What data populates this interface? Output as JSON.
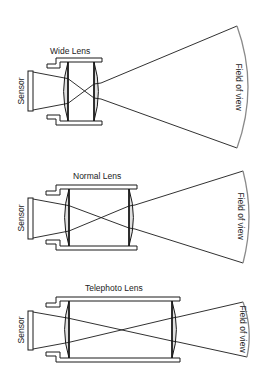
{
  "figure": {
    "width": 267,
    "height": 387,
    "background": "#ffffff",
    "line_color": "#1a1a1a",
    "lens_fill": "#e0e0e0",
    "arc_color": "#8a8a8a"
  },
  "diagrams": [
    {
      "id": "wide",
      "title": "Wide Lens",
      "sensor_label": "Sensor",
      "fov_label": "Field of view",
      "title_pos": [
        50,
        54
      ],
      "sensor_label_pos": [
        24,
        91
      ],
      "fov_label_pos": [
        236,
        87
      ],
      "housing": {
        "step_x": 47,
        "barrel_left": 56,
        "barrel_right": 102,
        "top": 58,
        "step_top": 64,
        "step_bottom": 119,
        "bottom": 125,
        "wall": 4
      },
      "sensor": {
        "x": 28,
        "y_top": 71,
        "y_bottom": 111,
        "w": 5
      },
      "lens_left": {
        "x": 68,
        "bulge": 4
      },
      "lens_right": {
        "x": 94,
        "bulge": 4
      },
      "rays": {
        "sensor_top": [
          33,
          72
        ],
        "sensor_bottom": [
          33,
          110
        ],
        "cross_x": 81,
        "cross_y": 91,
        "exit_top": [
          101,
          83
        ],
        "exit_bottom": [
          101,
          99
        ]
      },
      "fov": {
        "top": [
          237,
          26
        ],
        "bottom": [
          237,
          148
        ],
        "bulge": 11
      }
    },
    {
      "id": "normal",
      "title": "Normal Lens",
      "sensor_label": "Sensor",
      "fov_label": "Field of view",
      "title_pos": [
        73,
        179
      ],
      "sensor_label_pos": [
        24,
        218
      ],
      "fov_label_pos": [
        238,
        216
      ],
      "housing": {
        "step_x": 46,
        "barrel_left": 56,
        "barrel_right": 137,
        "top": 185,
        "step_top": 191,
        "step_bottom": 244,
        "bottom": 250,
        "wall": 4
      },
      "sensor": {
        "x": 28,
        "y_top": 198,
        "y_bottom": 239,
        "w": 5
      },
      "lens_left": {
        "x": 69,
        "bulge": 4
      },
      "lens_right": {
        "x": 129,
        "bulge": 4
      },
      "rays": {
        "sensor_top": [
          33,
          199
        ],
        "sensor_bottom": [
          33,
          238
        ],
        "cross_x": 97,
        "cross_y": 218,
        "exit_top": [
          135,
          205
        ],
        "exit_bottom": [
          135,
          229
        ]
      },
      "fov": {
        "top": [
          243,
          171
        ],
        "bottom": [
          243,
          263
        ],
        "bulge": 6
      }
    },
    {
      "id": "telephoto",
      "title": "Telephoto Lens",
      "sensor_label": "Sensor",
      "fov_label": "Field of view",
      "title_pos": [
        85,
        291
      ],
      "sensor_label_pos": [
        24,
        330
      ],
      "fov_label_pos": [
        240,
        329
      ],
      "housing": {
        "step_x": 46,
        "barrel_left": 56,
        "barrel_right": 180,
        "top": 297,
        "step_top": 303,
        "step_bottom": 356,
        "bottom": 362,
        "wall": 4
      },
      "sensor": {
        "x": 28,
        "y_top": 311,
        "y_bottom": 350,
        "w": 5
      },
      "lens_left": {
        "x": 69,
        "bulge": 4
      },
      "lens_right": {
        "x": 172,
        "bulge": 4
      },
      "rays": {
        "sensor_top": [
          33,
          312
        ],
        "sensor_bottom": [
          33,
          349
        ],
        "cross_x": 120,
        "cross_y": 330,
        "exit_top": [
          178,
          317
        ],
        "exit_bottom": [
          178,
          342
        ]
      },
      "fov": {
        "top": [
          243,
          302
        ],
        "bottom": [
          247,
          357
        ],
        "bulge": 3
      }
    }
  ]
}
